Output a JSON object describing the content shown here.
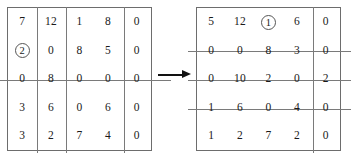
{
  "figure": {
    "type": "matrix-transformation-diagram",
    "arrow": {
      "name": "transform-arrow",
      "direction": "right",
      "label": ""
    },
    "line_color": "#7a7a7a",
    "border_color": "#6d6d6d",
    "arrow_color": "#121212"
  },
  "matrices": [
    {
      "id": "left",
      "rows": 5,
      "cols": 5,
      "values": [
        [
          "7",
          "12",
          "1",
          "8",
          "0"
        ],
        [
          "2",
          "0",
          "8",
          "5",
          "0"
        ],
        [
          "0",
          "8",
          "0",
          "0",
          "0"
        ],
        [
          "3",
          "6",
          "0",
          "6",
          "0"
        ],
        [
          "3",
          "2",
          "7",
          "4",
          "0"
        ]
      ],
      "circled": [
        {
          "row": 1,
          "col": 0,
          "value": "2"
        }
      ],
      "covering_lines": {
        "rows": [
          2
        ],
        "cols": [
          1,
          2,
          4
        ]
      }
    },
    {
      "id": "right",
      "rows": 5,
      "cols": 5,
      "values": [
        [
          "5",
          "12",
          "1",
          "6",
          "0"
        ],
        [
          "0",
          "0",
          "8",
          "3",
          "0"
        ],
        [
          "0",
          "10",
          "2",
          "0",
          "2"
        ],
        [
          "1",
          "6",
          "0",
          "4",
          "0"
        ],
        [
          "1",
          "2",
          "7",
          "2",
          "0"
        ]
      ],
      "circled": [
        {
          "row": 0,
          "col": 2,
          "value": "1"
        }
      ],
      "covering_lines": {
        "rows": [
          1,
          2,
          3
        ],
        "cols": [
          4
        ]
      }
    }
  ]
}
